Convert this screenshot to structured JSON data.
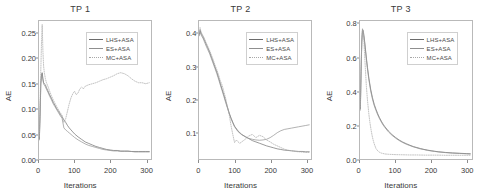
{
  "figure": {
    "background": "#ffffff",
    "panel_count": 3
  },
  "chart_data": [
    {
      "type": "line",
      "title": "TP 1",
      "xlabel": "Iterations",
      "ylabel": "AE",
      "xlim": [
        0,
        315
      ],
      "ylim": [
        0,
        0.275
      ],
      "xticks": [
        0,
        100,
        200,
        300
      ],
      "xticklabels": [
        "0",
        "100",
        "200",
        "300"
      ],
      "yticks": [
        0.0,
        0.05,
        0.1,
        0.15,
        0.2,
        0.25
      ],
      "yticklabels": [
        "0.00",
        "0.05",
        "0.10",
        "0.15",
        "0.20",
        "0.25"
      ],
      "grid": false,
      "legend_position": "upper right",
      "series": [
        {
          "name": "LHS+ASA",
          "color": "#6b6b6b",
          "linestyle": "solid",
          "x": [
            1,
            3,
            5,
            7,
            9,
            11,
            13,
            15,
            18,
            21,
            25,
            30,
            35,
            40,
            45,
            50,
            55,
            60,
            65,
            70,
            75,
            80,
            85,
            90,
            95,
            100,
            110,
            120,
            130,
            140,
            150,
            160,
            170,
            180,
            190,
            200,
            210,
            220,
            230,
            240,
            250,
            260,
            270,
            280,
            290,
            300,
            310
          ],
          "y": [
            0.04,
            0.09,
            0.15,
            0.165,
            0.172,
            0.16,
            0.152,
            0.15,
            0.148,
            0.142,
            0.136,
            0.128,
            0.121,
            0.113,
            0.107,
            0.1,
            0.095,
            0.089,
            0.084,
            0.078,
            0.073,
            0.067,
            0.062,
            0.058,
            0.054,
            0.05,
            0.044,
            0.039,
            0.034,
            0.031,
            0.028,
            0.025,
            0.023,
            0.021,
            0.019,
            0.018,
            0.017,
            0.017,
            0.016,
            0.016,
            0.016,
            0.015,
            0.015,
            0.015,
            0.015,
            0.015,
            0.015
          ]
        },
        {
          "name": "ES+ASA",
          "color": "#8f8f8f",
          "linestyle": "solid",
          "x": [
            1,
            3,
            5,
            7,
            9,
            11,
            13,
            15,
            18,
            21,
            25,
            30,
            35,
            40,
            45,
            50,
            55,
            60,
            65,
            70,
            75,
            80,
            85,
            90,
            95,
            100,
            110,
            120,
            130,
            140,
            150,
            160,
            170,
            180,
            190,
            200,
            210,
            220,
            230,
            240,
            250,
            260,
            270,
            280,
            290,
            300,
            310
          ],
          "y": [
            0.038,
            0.085,
            0.145,
            0.17,
            0.168,
            0.158,
            0.15,
            0.147,
            0.144,
            0.139,
            0.133,
            0.125,
            0.118,
            0.11,
            0.104,
            0.098,
            0.092,
            0.086,
            0.081,
            0.062,
            0.058,
            0.055,
            0.052,
            0.049,
            0.046,
            0.043,
            0.038,
            0.034,
            0.03,
            0.027,
            0.025,
            0.023,
            0.021,
            0.019,
            0.018,
            0.017,
            0.016,
            0.016,
            0.015,
            0.015,
            0.015,
            0.015,
            0.014,
            0.014,
            0.014,
            0.014,
            0.014
          ]
        },
        {
          "name": "MC+ASA",
          "color": "#a8a8a8",
          "linestyle": "dotted",
          "x": [
            1,
            3,
            5,
            7,
            9,
            11,
            13,
            15,
            18,
            21,
            25,
            30,
            35,
            40,
            45,
            50,
            55,
            60,
            65,
            70,
            75,
            80,
            85,
            90,
            95,
            100,
            105,
            110,
            115,
            120,
            125,
            130,
            140,
            150,
            160,
            170,
            180,
            190,
            200,
            210,
            220,
            230,
            240,
            250,
            260,
            270,
            280,
            290,
            300,
            310
          ],
          "y": [
            0.045,
            0.11,
            0.175,
            0.23,
            0.268,
            0.215,
            0.185,
            0.172,
            0.16,
            0.152,
            0.145,
            0.135,
            0.126,
            0.118,
            0.111,
            0.104,
            0.098,
            0.092,
            0.087,
            0.073,
            0.08,
            0.095,
            0.11,
            0.122,
            0.13,
            0.135,
            0.128,
            0.132,
            0.14,
            0.143,
            0.14,
            0.145,
            0.148,
            0.15,
            0.152,
            0.155,
            0.158,
            0.16,
            0.163,
            0.166,
            0.17,
            0.172,
            0.17,
            0.166,
            0.16,
            0.155,
            0.152,
            0.152,
            0.15,
            0.152
          ]
        }
      ]
    },
    {
      "type": "line",
      "title": "TP 2",
      "xlabel": "Iterations",
      "ylabel": "AE",
      "xlim": [
        0,
        315
      ],
      "ylim": [
        0.02,
        0.44
      ],
      "xticks": [
        0,
        100,
        200,
        300
      ],
      "xticklabels": [
        "0",
        "100",
        "200",
        "300"
      ],
      "yticks": [
        0.1,
        0.2,
        0.3,
        0.4
      ],
      "yticklabels": [
        "0.1",
        "0.2",
        "0.3",
        "0.4"
      ],
      "grid": false,
      "legend_position": "upper right",
      "series": [
        {
          "name": "LHS+ASA",
          "color": "#6b6b6b",
          "linestyle": "solid",
          "x": [
            1,
            3,
            5,
            8,
            11,
            14,
            17,
            20,
            25,
            30,
            35,
            40,
            45,
            50,
            55,
            60,
            65,
            70,
            75,
            80,
            85,
            90,
            95,
            100,
            110,
            120,
            130,
            140,
            150,
            160,
            170,
            180,
            190,
            200,
            210,
            220,
            230,
            240,
            250,
            260,
            270,
            280,
            290,
            300,
            310
          ],
          "y": [
            0.4,
            0.412,
            0.405,
            0.398,
            0.392,
            0.385,
            0.378,
            0.37,
            0.358,
            0.345,
            0.33,
            0.315,
            0.3,
            0.285,
            0.268,
            0.25,
            0.232,
            0.215,
            0.196,
            0.178,
            0.16,
            0.145,
            0.132,
            0.12,
            0.105,
            0.095,
            0.088,
            0.082,
            0.076,
            0.072,
            0.068,
            0.064,
            0.06,
            0.057,
            0.054,
            0.051,
            0.049,
            0.047,
            0.046,
            0.045,
            0.044,
            0.043,
            0.043,
            0.042,
            0.042
          ]
        },
        {
          "name": "ES+ASA",
          "color": "#8f8f8f",
          "linestyle": "solid",
          "x": [
            1,
            3,
            5,
            8,
            11,
            14,
            17,
            20,
            25,
            30,
            35,
            40,
            45,
            50,
            55,
            60,
            65,
            70,
            75,
            80,
            85,
            90,
            95,
            100,
            110,
            120,
            130,
            140,
            150,
            160,
            170,
            180,
            190,
            200,
            210,
            220,
            230,
            240,
            250,
            260,
            270,
            280,
            290,
            300,
            310
          ],
          "y": [
            0.395,
            0.408,
            0.4,
            0.393,
            0.388,
            0.38,
            0.372,
            0.364,
            0.352,
            0.34,
            0.325,
            0.31,
            0.295,
            0.28,
            0.263,
            0.245,
            0.228,
            0.21,
            0.192,
            0.175,
            0.158,
            0.143,
            0.13,
            0.118,
            0.103,
            0.094,
            0.088,
            0.083,
            0.08,
            0.078,
            0.077,
            0.078,
            0.08,
            0.085,
            0.092,
            0.1,
            0.106,
            0.11,
            0.112,
            0.114,
            0.116,
            0.118,
            0.12,
            0.122,
            0.124
          ]
        },
        {
          "name": "MC+ASA",
          "color": "#a8a8a8",
          "linestyle": "dotted",
          "x": [
            1,
            3,
            5,
            8,
            11,
            14,
            17,
            20,
            25,
            30,
            35,
            40,
            45,
            50,
            55,
            60,
            65,
            70,
            75,
            80,
            85,
            90,
            95,
            100,
            105,
            110,
            115,
            120,
            130,
            140,
            150,
            160,
            170,
            180,
            190,
            200,
            210,
            220,
            230,
            240,
            250,
            260,
            270,
            280,
            290,
            300,
            310
          ],
          "y": [
            0.405,
            0.42,
            0.41,
            0.402,
            0.396,
            0.39,
            0.382,
            0.374,
            0.362,
            0.35,
            0.336,
            0.322,
            0.306,
            0.292,
            0.276,
            0.258,
            0.245,
            0.225,
            0.205,
            0.178,
            0.155,
            0.122,
            0.095,
            0.07,
            0.078,
            0.072,
            0.068,
            0.072,
            0.08,
            0.09,
            0.095,
            0.085,
            0.092,
            0.088,
            0.078,
            0.072,
            0.065,
            0.06,
            0.055,
            0.05,
            0.047,
            0.045,
            0.043,
            0.042,
            0.041,
            0.04,
            0.04
          ]
        }
      ]
    },
    {
      "type": "line",
      "title": "TP 3",
      "xlabel": "Iterations",
      "ylabel": "AE",
      "xlim": [
        0,
        315
      ],
      "ylim": [
        0,
        0.82
      ],
      "xticks": [
        0,
        100,
        200,
        300
      ],
      "xticklabels": [
        "0",
        "100",
        "200",
        "300"
      ],
      "yticks": [
        0.0,
        0.2,
        0.4,
        0.6,
        0.8
      ],
      "yticklabels": [
        "0.0",
        "0.2",
        "0.4",
        "0.6",
        "0.8"
      ],
      "grid": false,
      "legend_position": "upper right",
      "series": [
        {
          "name": "LHS+ASA",
          "color": "#6b6b6b",
          "linestyle": "solid",
          "x": [
            1,
            3,
            5,
            7,
            9,
            11,
            13,
            15,
            18,
            21,
            25,
            30,
            35,
            40,
            45,
            50,
            55,
            60,
            65,
            70,
            80,
            90,
            100,
            110,
            120,
            130,
            140,
            150,
            160,
            170,
            180,
            190,
            200,
            210,
            220,
            240,
            260,
            280,
            300,
            310
          ],
          "y": [
            0.3,
            0.52,
            0.7,
            0.77,
            0.765,
            0.735,
            0.7,
            0.66,
            0.6,
            0.545,
            0.48,
            0.415,
            0.365,
            0.325,
            0.295,
            0.268,
            0.245,
            0.225,
            0.207,
            0.192,
            0.166,
            0.145,
            0.128,
            0.113,
            0.101,
            0.091,
            0.082,
            0.074,
            0.068,
            0.062,
            0.057,
            0.053,
            0.049,
            0.046,
            0.043,
            0.039,
            0.036,
            0.034,
            0.032,
            0.031
          ]
        },
        {
          "name": "ES+ASA",
          "color": "#8f8f8f",
          "linestyle": "solid",
          "x": [
            1,
            3,
            5,
            7,
            9,
            11,
            13,
            15,
            18,
            21,
            25,
            30,
            35,
            40,
            45,
            50,
            55,
            60,
            65,
            70,
            80,
            90,
            100,
            110,
            120,
            130,
            140,
            150,
            160,
            170,
            180,
            190,
            200,
            210,
            220,
            240,
            260,
            280,
            300,
            310
          ],
          "y": [
            0.29,
            0.505,
            0.69,
            0.76,
            0.755,
            0.725,
            0.69,
            0.65,
            0.59,
            0.535,
            0.47,
            0.405,
            0.356,
            0.317,
            0.288,
            0.261,
            0.239,
            0.219,
            0.202,
            0.187,
            0.161,
            0.141,
            0.124,
            0.11,
            0.098,
            0.088,
            0.08,
            0.072,
            0.066,
            0.06,
            0.056,
            0.051,
            0.048,
            0.045,
            0.042,
            0.038,
            0.035,
            0.033,
            0.031,
            0.03
          ]
        },
        {
          "name": "MC+ASA",
          "color": "#a8a8a8",
          "linestyle": "dotted",
          "x": [
            1,
            3,
            5,
            7,
            9,
            11,
            13,
            15,
            18,
            21,
            25,
            28,
            31,
            34,
            37,
            40,
            45,
            50,
            55,
            60,
            70,
            80,
            90,
            100,
            120,
            140,
            160,
            180,
            200,
            220,
            240,
            260,
            280,
            300,
            310
          ],
          "y": [
            0.31,
            0.53,
            0.71,
            0.775,
            0.76,
            0.7,
            0.62,
            0.54,
            0.43,
            0.35,
            0.265,
            0.215,
            0.175,
            0.14,
            0.112,
            0.09,
            0.062,
            0.048,
            0.04,
            0.035,
            0.03,
            0.028,
            0.027,
            0.026,
            0.025,
            0.024,
            0.024,
            0.023,
            0.023,
            0.023,
            0.022,
            0.022,
            0.022,
            0.022,
            0.022
          ]
        }
      ]
    }
  ]
}
